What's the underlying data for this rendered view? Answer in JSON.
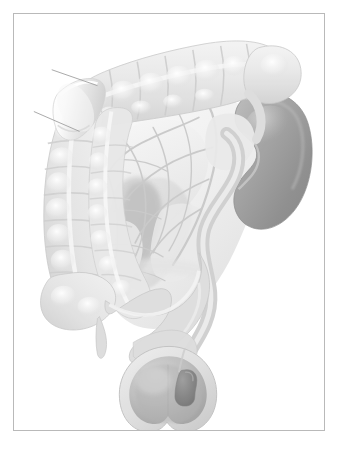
{
  "figure": {
    "kind": "anatomical-illustration",
    "style": "grayscale-airbrush-medical-illustration",
    "background_color": "#ffffff",
    "frame_border_color": "#b9b9b9",
    "palette": {
      "page_white": "#ffffff",
      "bowel_light": "#efefef",
      "bowel_mid": "#dcdcdc",
      "bowel_shadow": "#c4c4c4",
      "mesentery_light": "#f2f2f2",
      "mesentery_mid": "#e2e2e2",
      "vessel_line": "#c9c9c9",
      "kidney_dark": "#8f8f8f",
      "kidney_mid": "#a6a6a6",
      "kidney_light": "#bdbdbd",
      "ureter_gray": "#d2d2d2",
      "bladder_wall": "#d8d8d8",
      "bladder_lumen": "#b5b5b5",
      "lesion_dark": "#8a8a8a",
      "outline": "#bdbdbd",
      "pointer_line": "#9e9e9e"
    },
    "structures": [
      {
        "id": "transverse-colon",
        "label": "Transverse colon",
        "tone": "#e6e6e6",
        "haustra_count": 9
      },
      {
        "id": "hepatic-flexure",
        "label": "Hepatic flexure",
        "tone": "#e2e2e2"
      },
      {
        "id": "ascending-colon",
        "label": "Ascending colon",
        "tone": "#e4e4e4",
        "haustra_count": 8
      },
      {
        "id": "cecum",
        "label": "Cecum",
        "tone": "#e6e6e6"
      },
      {
        "id": "appendix",
        "label": "Vermiform appendix",
        "tone": "#dddddd"
      },
      {
        "id": "small-bowel-loop",
        "label": "Small bowel loop",
        "tone": "#e3e3e3"
      },
      {
        "id": "cut-bowel-segment",
        "label": "Transected bowel segment",
        "tone": "#f4f4f4"
      },
      {
        "id": "mesentery",
        "label": "Mesentery",
        "tone": "#f1f1f1"
      },
      {
        "id": "vascular-arcade",
        "label": "Mesenteric vascular arcade",
        "tone": "#cdcdcd"
      },
      {
        "id": "right-kidney",
        "label": "Right kidney",
        "tone": "#9a9a9a"
      },
      {
        "id": "renal-hilum",
        "label": "Renal hilum",
        "tone": "#c6c6c6"
      },
      {
        "id": "ureter",
        "label": "Ureter",
        "tone": "#d4d4d4"
      },
      {
        "id": "sigmoid-colon",
        "label": "Sigmoid colon",
        "tone": "#dcdcdc"
      },
      {
        "id": "urinary-bladder",
        "label": "Urinary bladder",
        "tone": "#d6d6d6"
      },
      {
        "id": "bladder-lesion",
        "label": "Bladder wall lesion",
        "tone": "#8a8a8a"
      },
      {
        "id": "pointer-line-upper",
        "label": "Leader line (upper)",
        "tone": "#9e9e9e"
      },
      {
        "id": "pointer-line-lower",
        "label": "Leader line (lower)",
        "tone": "#9e9e9e"
      }
    ],
    "text_labels": [],
    "notes": "No visible text, captions, legend or annotation labels appear anywhere in the image."
  }
}
